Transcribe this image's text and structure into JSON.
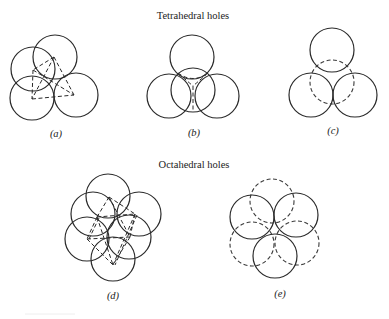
{
  "titles": {
    "tetrahedral": "Tetrahedral holes",
    "octahedral": "Octahedral holes"
  },
  "panels": [
    {
      "id": "a",
      "label": "(a)",
      "group": "tetrahedral",
      "description": "Four spheres with dashed tetrahedron edges joining their centers"
    },
    {
      "id": "b",
      "label": "(b)",
      "group": "tetrahedral",
      "description": "Sphere on top of three, dashed lines from hole to contact points"
    },
    {
      "id": "c",
      "label": "(c)",
      "group": "tetrahedral",
      "description": "Three spheres with one hidden sphere drawn dashed"
    },
    {
      "id": "d",
      "label": "(d)",
      "group": "octahedral",
      "description": "Six spheres with dashed octahedron edges"
    },
    {
      "id": "e",
      "label": "(e)",
      "group": "octahedral",
      "description": "Two layers of three spheres, one layer solid and one dashed"
    }
  ],
  "colors": {
    "line": "#2a2a2a",
    "background": "#ffffff"
  }
}
